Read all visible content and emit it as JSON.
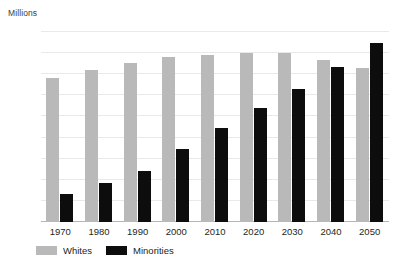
{
  "title_partial": "",
  "units_label": "Millions",
  "legend": {
    "items": [
      {
        "label": "Whites",
        "color": "#b9b9b9"
      },
      {
        "label": "Minorities",
        "color": "#0d0d0d"
      }
    ]
  },
  "chart_data": {
    "type": "bar",
    "title": "",
    "xlabel": "",
    "ylabel": "Millions",
    "ylim": [
      0,
      225
    ],
    "yticks": [
      0,
      25,
      50,
      75,
      100,
      125,
      150,
      175,
      200,
      225
    ],
    "grid": true,
    "legend_position": "bottom-left",
    "categories": [
      "1970",
      "1980",
      "1990",
      "2000",
      "2010",
      "2020",
      "2030",
      "2040",
      "2050"
    ],
    "series": [
      {
        "name": "Whites",
        "color": "#b9b9b9",
        "values": [
          170,
          180,
          188,
          196,
          198,
          200,
          200,
          192,
          182
        ]
      },
      {
        "name": "Minorities",
        "color": "#0d0d0d",
        "values": [
          33,
          46,
          60,
          86,
          111,
          135,
          158,
          184,
          212
        ]
      }
    ]
  }
}
